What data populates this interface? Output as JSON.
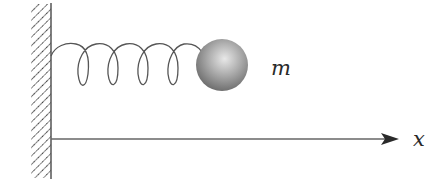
{
  "diagram": {
    "type": "spring-mass system",
    "mass_label": "m",
    "axis_label": "x",
    "components": {
      "wall": {
        "description": "fixed hatched wall on the left"
      },
      "spring": {
        "coils": 4,
        "description": "helical spring connecting wall to mass"
      },
      "mass": {
        "description": "shaded sphere attached to spring"
      },
      "axis": {
        "description": "horizontal position axis with arrow pointing right"
      }
    },
    "colors": {
      "line": "#555555",
      "hatch": "#3a3a3a",
      "mass_light": "#e6e6e6",
      "mass_dark": "#6e6e6e",
      "text": "#2a2a2a"
    }
  }
}
